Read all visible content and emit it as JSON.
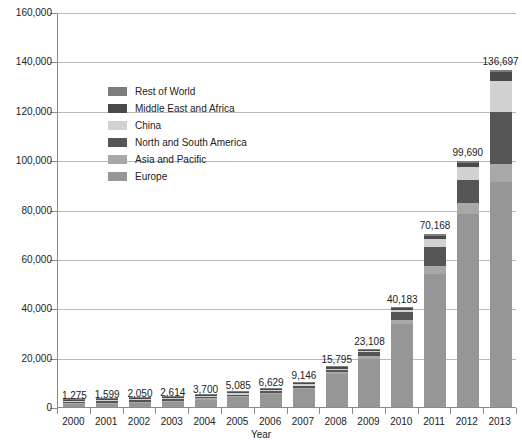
{
  "chart_data": {
    "type": "bar",
    "subtype": "stacked-bar",
    "title": "",
    "xlabel": "Year",
    "ylabel": "",
    "categories": [
      "2000",
      "2001",
      "2002",
      "2003",
      "2004",
      "2005",
      "2006",
      "2007",
      "2008",
      "2009",
      "2010",
      "2011",
      "2012",
      "2013"
    ],
    "ylim": [
      0,
      160000
    ],
    "ytick_values": [
      0,
      20000,
      40000,
      60000,
      80000,
      100000,
      120000,
      140000,
      160000
    ],
    "ytick_labels": [
      "0",
      "20,000",
      "40,000",
      "60,000",
      "80,000",
      "100,000",
      "120,000",
      "140,000",
      "160,000"
    ],
    "grid": true,
    "legend_position": "inside-upper-left",
    "totals": [
      1275,
      1599,
      2050,
      2614,
      3700,
      5085,
      6629,
      9146,
      15795,
      23108,
      40183,
      70168,
      99690,
      136697
    ],
    "total_labels": [
      "1,275",
      "1,599",
      "2,050",
      "2,614",
      "3,700",
      "5,085",
      "6,629",
      "9,146",
      "15,795",
      "23,108",
      "40,183",
      "70,168",
      "99,690",
      "136,697"
    ],
    "series": [
      {
        "name": "Europe",
        "color": "#969696",
        "values": [
          1050,
          1300,
          1700,
          2150,
          3000,
          4100,
          5300,
          7300,
          13200,
          19500,
          33500,
          54000,
          78000,
          91000
        ]
      },
      {
        "name": "Asia and Pacific",
        "color": "#a8a8a8",
        "values": [
          60,
          80,
          100,
          130,
          180,
          250,
          330,
          450,
          800,
          1200,
          1800,
          3000,
          4500,
          7500
        ]
      },
      {
        "name": "North and South America",
        "color": "#555555",
        "values": [
          90,
          110,
          140,
          180,
          300,
          420,
          600,
          900,
          1100,
          1500,
          3100,
          7800,
          9500,
          21000
        ]
      },
      {
        "name": "China",
        "color": "#d2d2d2",
        "values": [
          30,
          40,
          50,
          70,
          90,
          130,
          180,
          250,
          350,
          500,
          1000,
          3200,
          5200,
          12500
        ]
      },
      {
        "name": "Middle East and Africa",
        "color": "#4a4a4a",
        "values": [
          30,
          44,
          35,
          54,
          80,
          115,
          135,
          146,
          245,
          258,
          533,
          1468,
          1690,
          3597
        ]
      },
      {
        "name": "Rest of World",
        "color": "#7d7d7d",
        "values": [
          15,
          25,
          25,
          30,
          50,
          70,
          84,
          100,
          100,
          150,
          250,
          700,
          800,
          1100
        ]
      }
    ],
    "legend_entries": [
      {
        "label": "Rest of World",
        "color": "#7d7d7d"
      },
      {
        "label": "Middle East and Africa",
        "color": "#4a4a4a"
      },
      {
        "label": "China",
        "color": "#d2d2d2"
      },
      {
        "label": "North and South America",
        "color": "#555555"
      },
      {
        "label": "Asia and Pacific",
        "color": "#a8a8a8"
      },
      {
        "label": "Europe",
        "color": "#969696"
      }
    ]
  }
}
